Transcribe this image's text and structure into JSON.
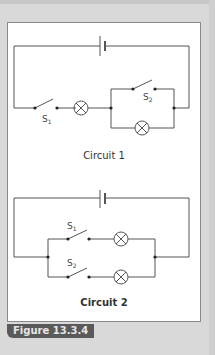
{
  "figure": {
    "label": "Figure 13.3.4",
    "circuit1": {
      "caption": "Circuit 1",
      "switch_labels": [
        "S1",
        "S2"
      ],
      "components": [
        "battery",
        "switch-S1",
        "lamp-1",
        "switch-S2 (parallel branch)",
        "lamp-2 (parallel branch)"
      ]
    },
    "circuit2": {
      "caption": "Circuit 2",
      "switch_labels": [
        "S1",
        "S2"
      ],
      "components": [
        "battery",
        "branch-1: switch-S1 + lamp",
        "branch-2: switch-S2 + lamp"
      ]
    }
  },
  "colors": {
    "background": "#d9d9d9",
    "panel": "#ffffff",
    "wire": "#555555",
    "label_bg": "#5a5a5a",
    "label_text": "#e6e6e6"
  }
}
